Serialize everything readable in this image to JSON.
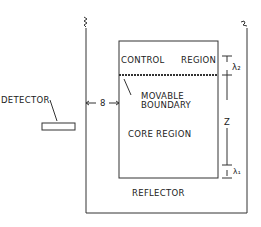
{
  "labels": {
    "detector": "DETECTOR",
    "control_region": "CONTROL",
    "control_region2": "REGION",
    "movable_boundary_1": "MOVABLE",
    "movable_boundary_2": "BOUNDARY",
    "core_region": "CORE REGION",
    "reflector": "REFLECTOR",
    "delta": "8",
    "z": "Z",
    "lambda2": "λ₂",
    "lambda1": "λ₁"
  },
  "colors": {
    "line": "#333333",
    "background": "#ffffff"
  }
}
